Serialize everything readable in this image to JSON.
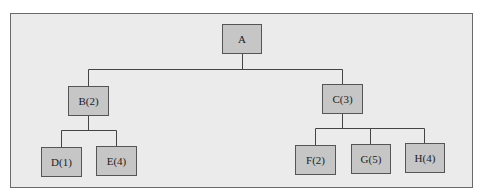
{
  "diagram": {
    "type": "tree",
    "colors": {
      "background": "#ebebeb",
      "node_fill": "#c6c6c6",
      "border": "#555555",
      "line": "#444444"
    },
    "nodes": {
      "A": {
        "label": "A"
      },
      "B": {
        "label": "B(2)"
      },
      "C": {
        "label": "C(3)"
      },
      "D": {
        "label": "D(1)"
      },
      "E": {
        "label": "E(4)"
      },
      "F": {
        "label": "F(2)"
      },
      "G": {
        "label": "G(5)"
      },
      "H": {
        "label": "H(4)"
      }
    },
    "edges": [
      [
        "A",
        "B"
      ],
      [
        "A",
        "C"
      ],
      [
        "B",
        "D"
      ],
      [
        "B",
        "E"
      ],
      [
        "C",
        "F"
      ],
      [
        "C",
        "G"
      ],
      [
        "C",
        "H"
      ]
    ]
  }
}
